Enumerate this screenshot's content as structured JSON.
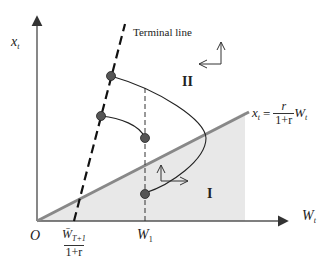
{
  "axes": {
    "y_label": "x",
    "y_label_sub": "t",
    "x_label": "W",
    "x_label_sub": "t",
    "origin_label": "O"
  },
  "terminal_line": {
    "label": "Terminal line"
  },
  "boundary_line": {
    "lhs": "x",
    "lhs_sub": "t",
    "equals": "=",
    "numerator": "r",
    "denominator": "1+r",
    "rhs": "W",
    "rhs_sub": "t"
  },
  "x_ticks": {
    "terminal_intercept": {
      "numerator": "W̄",
      "numerator_sub": "T+1",
      "denominator": "1+r"
    },
    "w1": {
      "label": "W",
      "sub": "1"
    }
  },
  "regions": {
    "region_1": "I",
    "region_2": "II"
  },
  "colors": {
    "axis": "#555555",
    "boundary": "#8a8a8a",
    "shade": "#e6e6e6",
    "curve": "#222222",
    "point": "#555555",
    "terminal": "#111111"
  }
}
